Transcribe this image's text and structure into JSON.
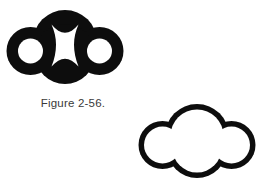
{
  "figure": {
    "caption": "Figure 2-56.",
    "background_color": "#ffffff",
    "ink_color": "#0d0d0d",
    "caption_color": "#3a3a3a",
    "shapes": [
      {
        "name": "filled-cloud-figure",
        "position": "top-left",
        "style": "solid black silhouette with white cut-outs",
        "description": "Cloud/trefoil silhouette formed from one large central circle and two smaller flanking circles, filled solid black, containing two small white circular holes at left and right and a central white concave-sided hourglass region"
      },
      {
        "name": "outlined-cloud-figure",
        "position": "bottom-right",
        "style": "black outline, white interior",
        "description": "Same cloud/trefoil contour drawn as a thin closed black outline with an empty white interior"
      }
    ]
  }
}
